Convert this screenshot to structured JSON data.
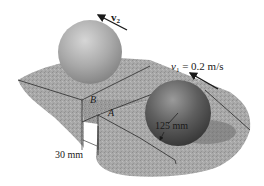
{
  "figure": {
    "colors": {
      "background": "#ffffff",
      "surface": "#a9a9a9",
      "surface_dark": "#8e8e8e",
      "edge_line": "#2a2a2a",
      "sphere_upper": "#a6a6a6",
      "sphere_lower": "#5e5e5e",
      "arrow": "#1a1a1a"
    }
  },
  "labels": {
    "v2": {
      "symbol": "v",
      "subscript": "2"
    },
    "v1": {
      "symbol": "v",
      "subscript": "1",
      "equals": " = 0.2 m/s"
    },
    "point_b": "B",
    "point_a": "A",
    "radius": "125 mm",
    "step_height": "30 mm"
  }
}
